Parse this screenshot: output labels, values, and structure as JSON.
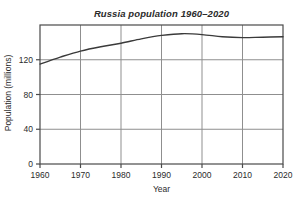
{
  "window": {
    "width": 304,
    "height": 206,
    "background": "#ffffff"
  },
  "chart_data": {
    "type": "line",
    "title": "Russia population 1960–2020",
    "xlabel": "Year",
    "ylabel": "Population (millions)",
    "x": [
      1960,
      1965,
      1970,
      1975,
      1980,
      1985,
      1990,
      1995,
      2000,
      2005,
      2010,
      2015,
      2020
    ],
    "y": [
      115,
      123,
      130,
      135,
      139,
      144,
      148,
      150,
      149,
      146.5,
      145.5,
      146,
      146.5
    ],
    "xlim": [
      1960,
      2020
    ],
    "ylim": [
      0,
      160
    ],
    "xticks": [
      1960,
      1970,
      1980,
      1990,
      2000,
      2010,
      2020
    ],
    "yticks": [
      0,
      40,
      80,
      120
    ],
    "grid": true,
    "legend": "none",
    "line_color": "#3a3a3a",
    "grid_color": "#8f8f8f",
    "axis_color": "#4a4a4a",
    "text_color": "#2b2b2b"
  }
}
